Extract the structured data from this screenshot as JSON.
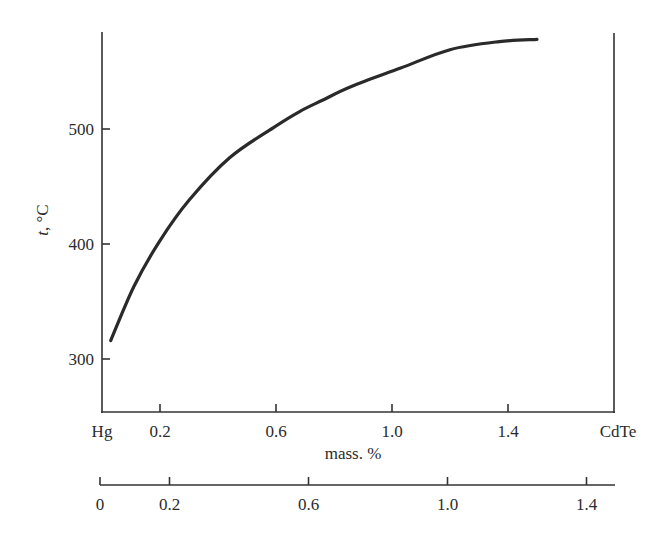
{
  "chart_data": {
    "type": "line",
    "title": "",
    "xlabel": "mass. %",
    "ylabel": "t, °C",
    "ylabel_italic_part": "t",
    "ylabel_rest": ", °C",
    "x_endpoint_labels": {
      "left": "Hg",
      "right": "CdTe"
    },
    "xlim": [
      0,
      1.77
    ],
    "ylim": [
      255,
      610
    ],
    "x_ticks": [
      0.2,
      0.6,
      1.0,
      1.4
    ],
    "x_tick_labels": [
      "0.2",
      "0.6",
      "1.0",
      "1.4"
    ],
    "y_ticks": [
      300,
      400,
      500
    ],
    "y_tick_labels": [
      "300",
      "400",
      "500"
    ],
    "secondary_x_axis": {
      "ticks": [
        0,
        0.2,
        0.6,
        1.0,
        1.4
      ],
      "tick_labels": [
        "0",
        "0.2",
        "0.6",
        "1.0",
        "1.4"
      ]
    },
    "grid": false,
    "legend": null,
    "series": [
      {
        "name": "liquidus",
        "x": [
          0.03,
          0.11,
          0.2,
          0.3,
          0.44,
          0.59,
          0.68,
          0.76,
          0.86,
          1.03,
          1.2,
          1.37,
          1.5
        ],
        "y": [
          316,
          363,
          403,
          438,
          475,
          501,
          515,
          525,
          537,
          553,
          569,
          576,
          578
        ]
      }
    ]
  },
  "style": {
    "line_color": "#2a2a2a",
    "axis_color": "#333333"
  }
}
